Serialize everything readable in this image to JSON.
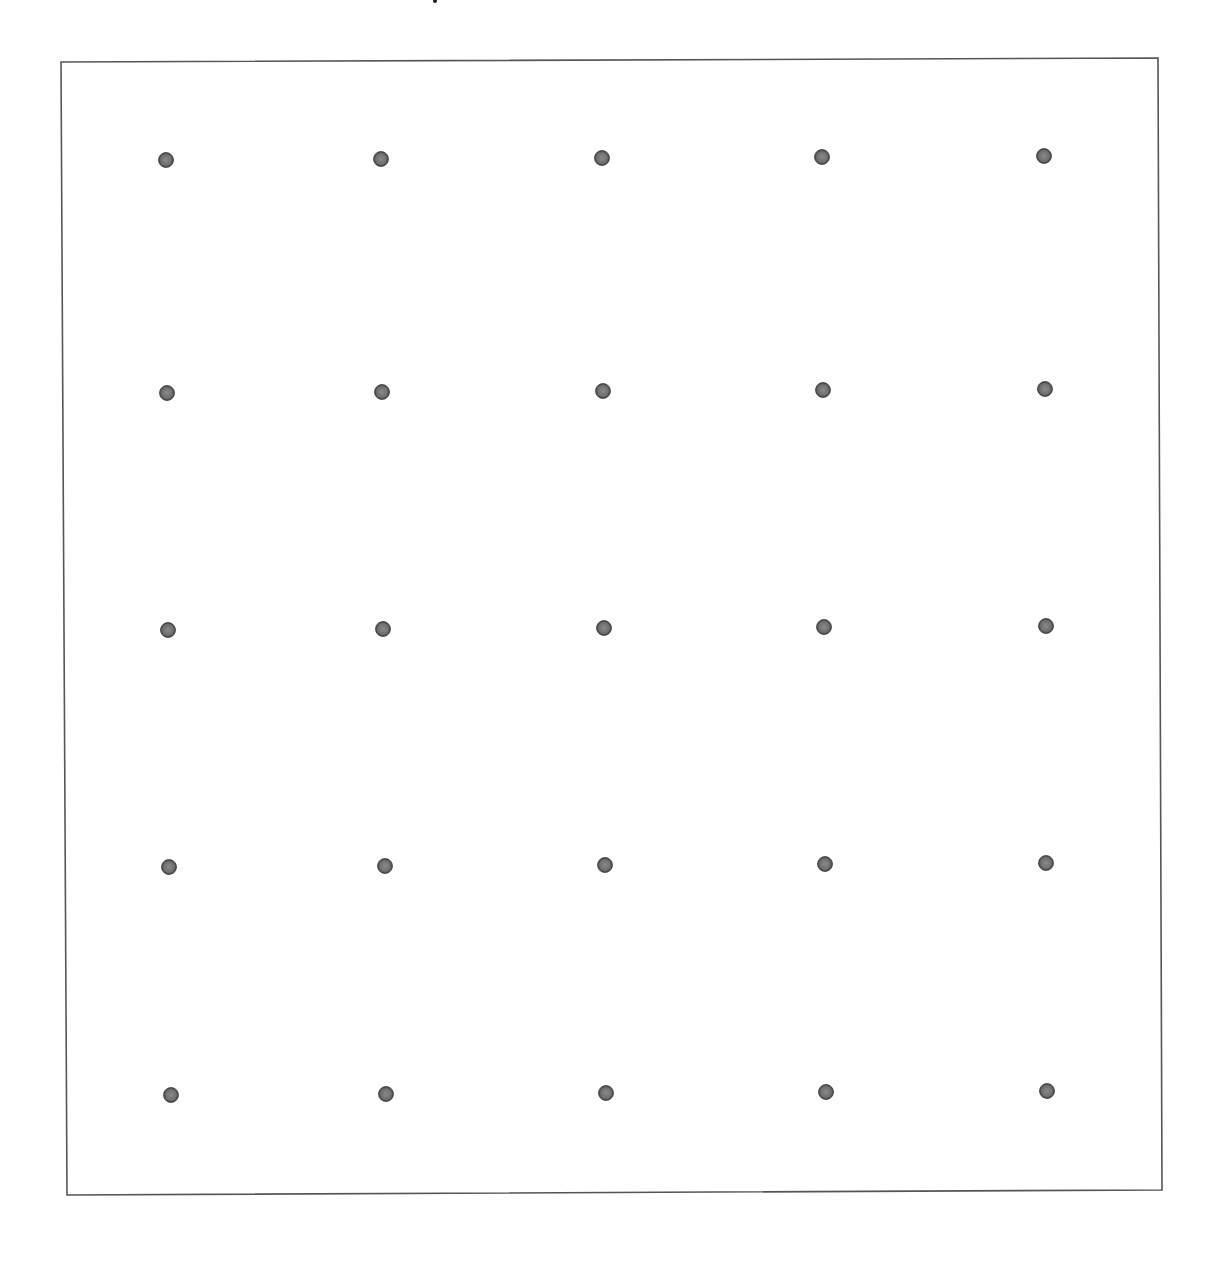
{
  "diagram": {
    "type": "dot-grid",
    "rows": 5,
    "columns": 5,
    "frame": {
      "corners": {
        "top_left": [
          61,
          62
        ],
        "top_right": [
          1158,
          58
        ],
        "bottom_right": [
          1162,
          1190
        ],
        "bottom_left": [
          67,
          1195
        ]
      },
      "stroke_color": "#555555",
      "stroke_width": 1.6
    },
    "dot_style": {
      "radius": 7.5,
      "fill_color": "#6f6f6f",
      "edge_color": "#3f3f3f",
      "highlight_color": "#8a8a8a"
    },
    "dots": [
      [
        [
          166,
          160
        ],
        [
          381,
          159
        ],
        [
          602,
          158
        ],
        [
          822,
          157
        ],
        [
          1044,
          156
        ]
      ],
      [
        [
          167,
          393
        ],
        [
          382,
          392
        ],
        [
          603,
          391
        ],
        [
          823,
          390
        ],
        [
          1045,
          389
        ]
      ],
      [
        [
          168,
          630
        ],
        [
          383,
          629
        ],
        [
          604,
          628
        ],
        [
          824,
          627
        ],
        [
          1046,
          626
        ]
      ],
      [
        [
          169,
          867
        ],
        [
          385,
          866
        ],
        [
          605,
          865
        ],
        [
          825,
          864
        ],
        [
          1046,
          863
        ]
      ],
      [
        [
          171,
          1095
        ],
        [
          386,
          1094
        ],
        [
          606,
          1093
        ],
        [
          826,
          1092
        ],
        [
          1047,
          1091
        ]
      ]
    ]
  }
}
